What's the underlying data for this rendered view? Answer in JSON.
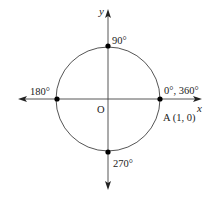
{
  "diagram": {
    "type": "unit-circle",
    "axes": {
      "x_label": "x",
      "y_label": "y"
    },
    "origin_label": "O",
    "points": [
      {
        "name": "point-0-360",
        "label": "0°, 360°",
        "sub_label": "A (1, 0)"
      },
      {
        "name": "point-90",
        "label": "90°"
      },
      {
        "name": "point-180",
        "label": "180°"
      },
      {
        "name": "point-270",
        "label": "270°"
      }
    ],
    "colors": {
      "stroke": "#333333",
      "circle": "#555555",
      "point": "#000000"
    }
  }
}
